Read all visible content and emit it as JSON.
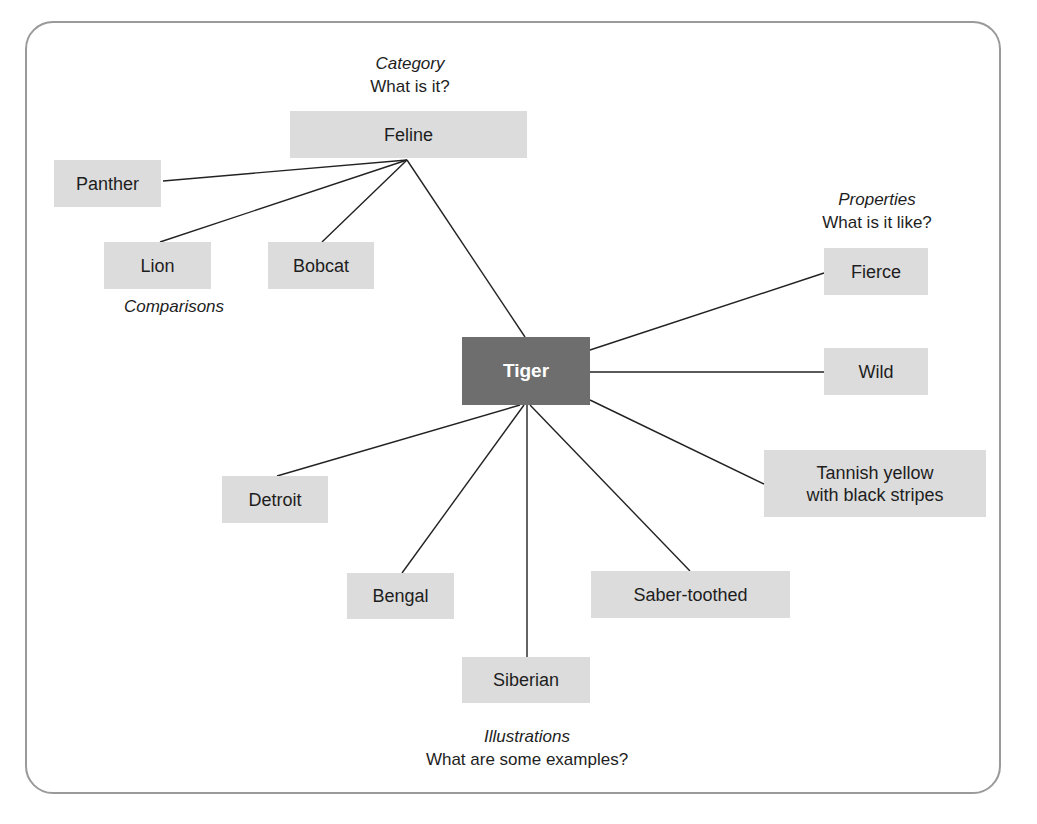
{
  "diagram": {
    "type": "concept-map",
    "center": {
      "label": "Tiger",
      "color": "#6e6e6e"
    },
    "node_color": "#dcdcdc",
    "groups": {
      "category": {
        "heading": "Category",
        "question": "What is it?"
      },
      "comparisons": {
        "heading": "Comparisons"
      },
      "properties": {
        "heading": "Properties",
        "question": "What is it like?"
      },
      "illustrations": {
        "heading": "Illustrations",
        "question": "What are some examples?"
      }
    },
    "nodes": {
      "feline": "Feline",
      "panther": "Panther",
      "lion": "Lion",
      "bobcat": "Bobcat",
      "fierce": "Fierce",
      "wild": "Wild",
      "tannish": "Tannish yellow with black stripes",
      "tannish_line1": "Tannish yellow",
      "tannish_line2": "with black stripes",
      "detroit": "Detroit",
      "bengal": "Bengal",
      "siberian": "Siberian",
      "saber": "Saber-toothed"
    },
    "edges": [
      [
        "Tiger",
        "Feline"
      ],
      [
        "Feline",
        "Panther"
      ],
      [
        "Feline",
        "Lion"
      ],
      [
        "Feline",
        "Bobcat"
      ],
      [
        "Tiger",
        "Fierce"
      ],
      [
        "Tiger",
        "Wild"
      ],
      [
        "Tiger",
        "Tannish yellow with black stripes"
      ],
      [
        "Tiger",
        "Detroit"
      ],
      [
        "Tiger",
        "Bengal"
      ],
      [
        "Tiger",
        "Siberian"
      ],
      [
        "Tiger",
        "Saber-toothed"
      ]
    ]
  }
}
